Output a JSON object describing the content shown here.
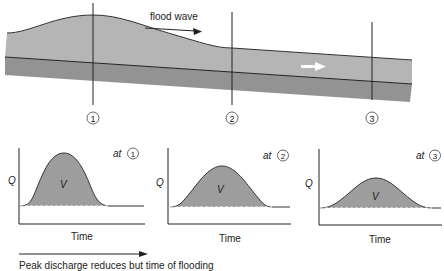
{
  "channel": {
    "wave_label": "flood wave",
    "flow_direction": "downstream-arrow",
    "sections": [
      {
        "id": "1",
        "symbol": "①",
        "x": 93
      },
      {
        "id": "2",
        "symbol": "②",
        "x": 232
      },
      {
        "id": "3",
        "symbol": "③",
        "x": 372
      }
    ]
  },
  "hydrographs": [
    {
      "section": "1",
      "label_prefix": "at",
      "symbol": "①",
      "y_label": "Q",
      "x_label": "Time",
      "area_label": "V",
      "peak": "high"
    },
    {
      "section": "2",
      "label_prefix": "at",
      "symbol": "②",
      "y_label": "Q",
      "x_label": "Time",
      "area_label": "V",
      "peak": "medium"
    },
    {
      "section": "3",
      "label_prefix": "at",
      "symbol": "③",
      "y_label": "Q",
      "x_label": "Time",
      "area_label": "V",
      "peak": "low"
    }
  ],
  "caption": "Peak discharge reduces but time of flooding",
  "colors": {
    "water": "#b3b3b3",
    "bed": "#939393",
    "hydrograph_fill": "#9d9d9d",
    "line": "#222222"
  }
}
